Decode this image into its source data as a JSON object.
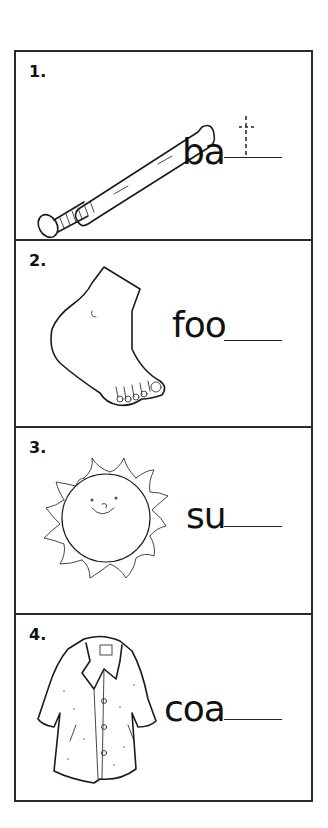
{
  "worksheet": {
    "items": [
      {
        "number": "1.",
        "prefix": "ba",
        "answer_hint": "t",
        "picture": "baseball-bat"
      },
      {
        "number": "2.",
        "prefix": "foo",
        "picture": "foot"
      },
      {
        "number": "3.",
        "prefix": "su",
        "picture": "sun"
      },
      {
        "number": "4.",
        "prefix": "coa",
        "picture": "coat"
      }
    ]
  },
  "colors": {
    "ink": "#1a1a1a",
    "border": "#2a2a2a",
    "background": "#ffffff"
  }
}
